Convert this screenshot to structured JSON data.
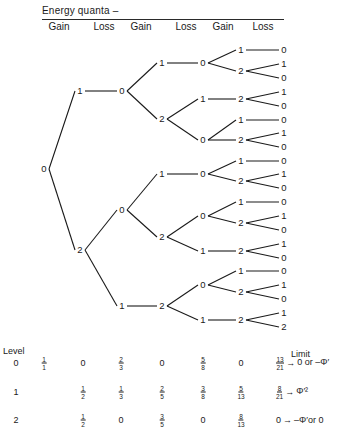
{
  "header": {
    "title": "Energy quanta –",
    "columns": [
      {
        "label": "Gain",
        "x": 59
      },
      {
        "label": "Loss",
        "x": 104
      },
      {
        "label": "Gain",
        "x": 141
      },
      {
        "label": "Loss",
        "x": 186
      },
      {
        "label": "Gain",
        "x": 223
      },
      {
        "label": "Loss",
        "x": 263
      }
    ]
  },
  "tree": {
    "nodes": [
      {
        "id": "r",
        "label": "0",
        "x": 44,
        "y": 169
      },
      {
        "id": "a",
        "label": "1",
        "x": 80,
        "y": 91
      },
      {
        "id": "b",
        "label": "2",
        "x": 80,
        "y": 250
      },
      {
        "id": "a0",
        "label": "0",
        "x": 122,
        "y": 91
      },
      {
        "id": "b0",
        "label": "0",
        "x": 122,
        "y": 210
      },
      {
        "id": "b1",
        "label": "1",
        "x": 122,
        "y": 306
      },
      {
        "id": "c1",
        "label": "1",
        "x": 162,
        "y": 63
      },
      {
        "id": "c2",
        "label": "2",
        "x": 162,
        "y": 119
      },
      {
        "id": "c3",
        "label": "1",
        "x": 162,
        "y": 174
      },
      {
        "id": "c4",
        "label": "2",
        "x": 162,
        "y": 237
      },
      {
        "id": "c5",
        "label": "2",
        "x": 162,
        "y": 306
      },
      {
        "id": "d1",
        "label": "0",
        "x": 203,
        "y": 63
      },
      {
        "id": "d2",
        "label": "1",
        "x": 203,
        "y": 99
      },
      {
        "id": "d3",
        "label": "0",
        "x": 203,
        "y": 140
      },
      {
        "id": "d4",
        "label": "0",
        "x": 203,
        "y": 174
      },
      {
        "id": "d5",
        "label": "0",
        "x": 203,
        "y": 216
      },
      {
        "id": "d6",
        "label": "1",
        "x": 203,
        "y": 251
      },
      {
        "id": "d7",
        "label": "0",
        "x": 203,
        "y": 285
      },
      {
        "id": "d8",
        "label": "1",
        "x": 203,
        "y": 320
      },
      {
        "id": "e1",
        "label": "1",
        "x": 241,
        "y": 50
      },
      {
        "id": "e2",
        "label": "2",
        "x": 241,
        "y": 71
      },
      {
        "id": "e3",
        "label": "2",
        "x": 241,
        "y": 99
      },
      {
        "id": "e4",
        "label": "1",
        "x": 241,
        "y": 120
      },
      {
        "id": "e5",
        "label": "2",
        "x": 241,
        "y": 140
      },
      {
        "id": "e6",
        "label": "1",
        "x": 241,
        "y": 161
      },
      {
        "id": "e7",
        "label": "2",
        "x": 241,
        "y": 181
      },
      {
        "id": "e8",
        "label": "1",
        "x": 241,
        "y": 202
      },
      {
        "id": "e9",
        "label": "2",
        "x": 241,
        "y": 223
      },
      {
        "id": "e10",
        "label": "2",
        "x": 241,
        "y": 251
      },
      {
        "id": "e11",
        "label": "1",
        "x": 241,
        "y": 271
      },
      {
        "id": "e12",
        "label": "2",
        "x": 241,
        "y": 292
      },
      {
        "id": "e13",
        "label": "2",
        "x": 241,
        "y": 320
      },
      {
        "id": "f1",
        "label": "0",
        "x": 284,
        "y": 50
      },
      {
        "id": "f2",
        "label": "1",
        "x": 284,
        "y": 64
      },
      {
        "id": "f3",
        "label": "0",
        "x": 284,
        "y": 78
      },
      {
        "id": "f4",
        "label": "1",
        "x": 284,
        "y": 92
      },
      {
        "id": "f5",
        "label": "0",
        "x": 284,
        "y": 106
      },
      {
        "id": "f6",
        "label": "0",
        "x": 284,
        "y": 120
      },
      {
        "id": "f7",
        "label": "1",
        "x": 284,
        "y": 133
      },
      {
        "id": "f8",
        "label": "0",
        "x": 284,
        "y": 147
      },
      {
        "id": "f9",
        "label": "0",
        "x": 284,
        "y": 161
      },
      {
        "id": "f10",
        "label": "1",
        "x": 284,
        "y": 174
      },
      {
        "id": "f11",
        "label": "0",
        "x": 284,
        "y": 188
      },
      {
        "id": "f12",
        "label": "0",
        "x": 284,
        "y": 202
      },
      {
        "id": "f13",
        "label": "1",
        "x": 284,
        "y": 216
      },
      {
        "id": "f14",
        "label": "0",
        "x": 284,
        "y": 230
      },
      {
        "id": "f15",
        "label": "1",
        "x": 284,
        "y": 244
      },
      {
        "id": "f16",
        "label": "0",
        "x": 284,
        "y": 258
      },
      {
        "id": "f17",
        "label": "0",
        "x": 284,
        "y": 271
      },
      {
        "id": "f18",
        "label": "1",
        "x": 284,
        "y": 285
      },
      {
        "id": "f19",
        "label": "0",
        "x": 284,
        "y": 299
      },
      {
        "id": "f20",
        "label": "1",
        "x": 284,
        "y": 313
      },
      {
        "id": "f21",
        "label": "2",
        "x": 284,
        "y": 327
      }
    ],
    "edges": [
      [
        "r",
        "a"
      ],
      [
        "r",
        "b"
      ],
      [
        "a",
        "a0"
      ],
      [
        "b",
        "b0"
      ],
      [
        "b",
        "b1"
      ],
      [
        "a0",
        "c1"
      ],
      [
        "a0",
        "c2"
      ],
      [
        "b0",
        "c3"
      ],
      [
        "b0",
        "c4"
      ],
      [
        "b1",
        "c5"
      ],
      [
        "c1",
        "d1"
      ],
      [
        "c2",
        "d2"
      ],
      [
        "c2",
        "d3"
      ],
      [
        "c3",
        "d4"
      ],
      [
        "c4",
        "d5"
      ],
      [
        "c4",
        "d6"
      ],
      [
        "c5",
        "d7"
      ],
      [
        "c5",
        "d8"
      ],
      [
        "d1",
        "e1"
      ],
      [
        "d1",
        "e2"
      ],
      [
        "d2",
        "e3"
      ],
      [
        "d3",
        "e4"
      ],
      [
        "d3",
        "e5"
      ],
      [
        "d4",
        "e6"
      ],
      [
        "d4",
        "e7"
      ],
      [
        "d5",
        "e8"
      ],
      [
        "d5",
        "e9"
      ],
      [
        "d6",
        "e10"
      ],
      [
        "d7",
        "e11"
      ],
      [
        "d7",
        "e12"
      ],
      [
        "d8",
        "e13"
      ],
      [
        "e1",
        "f1"
      ],
      [
        "e2",
        "f2"
      ],
      [
        "e2",
        "f3"
      ],
      [
        "e3",
        "f4"
      ],
      [
        "e3",
        "f5"
      ],
      [
        "e4",
        "f6"
      ],
      [
        "e5",
        "f7"
      ],
      [
        "e5",
        "f8"
      ],
      [
        "e6",
        "f9"
      ],
      [
        "e7",
        "f10"
      ],
      [
        "e7",
        "f11"
      ],
      [
        "e8",
        "f12"
      ],
      [
        "e9",
        "f13"
      ],
      [
        "e9",
        "f14"
      ],
      [
        "e10",
        "f15"
      ],
      [
        "e10",
        "f16"
      ],
      [
        "e11",
        "f17"
      ],
      [
        "e12",
        "f18"
      ],
      [
        "e12",
        "f19"
      ],
      [
        "e13",
        "f20"
      ],
      [
        "e13",
        "f21"
      ]
    ]
  },
  "table": {
    "level_title": "Level",
    "limit_title": "Limit",
    "col_x": [
      16,
      44,
      83,
      121,
      162,
      203,
      241,
      284
    ],
    "rows": [
      {
        "level": "0",
        "y": 363,
        "cells": [
          {
            "n": "1",
            "d": "1"
          },
          "0",
          {
            "n": "2",
            "d": "3"
          },
          "0",
          {
            "n": "5",
            "d": "8"
          },
          "0"
        ],
        "limit": {
          "frac": {
            "n": "13",
            "d": "21"
          },
          "arrow": "→",
          "text": "0 or –Φ′"
        }
      },
      {
        "level": "1",
        "y": 392,
        "cells": [
          null,
          {
            "n": "1",
            "d": "2"
          },
          {
            "n": "1",
            "d": "3"
          },
          {
            "n": "2",
            "d": "5"
          },
          {
            "n": "3",
            "d": "8"
          },
          {
            "n": "5",
            "d": "13"
          }
        ],
        "limit": {
          "frac": {
            "n": "8",
            "d": "21"
          },
          "arrow": "→",
          "text": "Φ′²"
        }
      },
      {
        "level": "2",
        "y": 420,
        "cells": [
          null,
          {
            "n": "1",
            "d": "2"
          },
          "0",
          {
            "n": "3",
            "d": "5"
          },
          "0",
          {
            "n": "8",
            "d": "13"
          }
        ],
        "limit": {
          "frac": "0",
          "arrow": "→",
          "text": "–Φ′or 0"
        }
      }
    ]
  }
}
